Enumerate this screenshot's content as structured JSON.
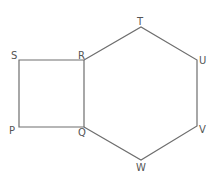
{
  "diagram": {
    "type": "geometry",
    "stroke_color": "#6e6e6e",
    "label_color": "#555555",
    "shapes": [
      {
        "name": "square",
        "vertices": [
          "P",
          "Q",
          "R",
          "S"
        ]
      },
      {
        "name": "hexagon",
        "vertices": [
          "R",
          "T",
          "U",
          "V",
          "W",
          "Q"
        ]
      }
    ],
    "labels": {
      "S": "S",
      "R": "R",
      "T": "T",
      "U": "U",
      "V": "V",
      "W": "W",
      "Q": "Q",
      "P": "P"
    },
    "points": {
      "S": [
        19,
        60
      ],
      "R": [
        84,
        60
      ],
      "T": [
        141,
        27
      ],
      "U": [
        197,
        60
      ],
      "V": [
        197,
        126
      ],
      "W": [
        141,
        160
      ],
      "Q": [
        84,
        127
      ],
      "P": [
        19,
        127
      ]
    }
  }
}
